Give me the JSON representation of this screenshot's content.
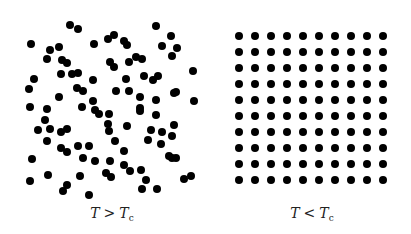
{
  "figure": {
    "dot_color": "#000000",
    "dot_radius": 4,
    "background": "#ffffff"
  },
  "panels": [
    {
      "name": "disordered",
      "caption": {
        "var": "T",
        "op": ">",
        "var2": "T",
        "sub": "c"
      },
      "caption_pos": {
        "x": 112,
        "y": 205
      },
      "dots": [
        [
          70,
          25
        ],
        [
          78,
          29
        ],
        [
          156,
          26
        ],
        [
          31,
          44
        ],
        [
          50,
          50
        ],
        [
          59,
          47
        ],
        [
          94,
          44
        ],
        [
          108,
          39
        ],
        [
          114,
          35
        ],
        [
          124,
          41
        ],
        [
          127,
          45
        ],
        [
          171,
          36
        ],
        [
          162,
          46
        ],
        [
          177,
          48
        ],
        [
          47,
          59
        ],
        [
          62,
          60
        ],
        [
          67,
          63
        ],
        [
          110,
          62
        ],
        [
          114,
          67
        ],
        [
          129,
          62
        ],
        [
          136,
          57
        ],
        [
          142,
          59
        ],
        [
          172,
          56
        ],
        [
          193,
          71
        ],
        [
          34,
          79
        ],
        [
          61,
          74
        ],
        [
          72,
          74
        ],
        [
          78,
          73
        ],
        [
          93,
          80
        ],
        [
          126,
          79
        ],
        [
          144,
          76
        ],
        [
          153,
          80
        ],
        [
          158,
          76
        ],
        [
          29,
          89
        ],
        [
          77,
          88
        ],
        [
          83,
          91
        ],
        [
          116,
          91
        ],
        [
          129,
          91
        ],
        [
          174,
          93
        ],
        [
          176,
          92
        ],
        [
          59,
          97
        ],
        [
          93,
          101
        ],
        [
          140,
          97
        ],
        [
          156,
          100
        ],
        [
          194,
          101
        ],
        [
          30,
          107
        ],
        [
          47,
          109
        ],
        [
          82,
          107
        ],
        [
          95,
          110
        ],
        [
          99,
          114
        ],
        [
          109,
          114
        ],
        [
          140,
          108
        ],
        [
          140,
          111
        ],
        [
          156,
          115
        ],
        [
          45,
          120
        ],
        [
          38,
          130
        ],
        [
          50,
          129
        ],
        [
          61,
          132
        ],
        [
          67,
          129
        ],
        [
          47,
          141
        ],
        [
          108,
          124
        ],
        [
          109,
          131
        ],
        [
          127,
          126
        ],
        [
          115,
          141
        ],
        [
          151,
          130
        ],
        [
          162,
          132
        ],
        [
          174,
          125
        ],
        [
          172,
          136
        ],
        [
          148,
          140
        ],
        [
          161,
          144
        ],
        [
          61,
          148
        ],
        [
          67,
          152
        ],
        [
          78,
          146
        ],
        [
          89,
          146
        ],
        [
          83,
          158
        ],
        [
          95,
          161
        ],
        [
          110,
          161
        ],
        [
          124,
          151
        ],
        [
          124,
          165
        ],
        [
          130,
          171
        ],
        [
          141,
          170
        ],
        [
          146,
          180
        ],
        [
          169,
          156
        ],
        [
          172,
          158
        ],
        [
          176,
          158
        ],
        [
          32,
          159
        ],
        [
          48,
          175
        ],
        [
          80,
          176
        ],
        [
          106,
          173
        ],
        [
          111,
          177
        ],
        [
          30,
          181
        ],
        [
          67,
          185
        ],
        [
          63,
          191
        ],
        [
          89,
          195
        ],
        [
          142,
          189
        ],
        [
          157,
          189
        ],
        [
          184,
          179
        ],
        [
          191,
          176
        ]
      ]
    },
    {
      "name": "ordered-lattice",
      "caption": {
        "var": "T",
        "op": "<",
        "var2": "T",
        "sub": "c"
      },
      "caption_pos": {
        "x": 312,
        "y": 205
      },
      "grid": {
        "cols": 10,
        "rows": 10,
        "x0": 239,
        "y0": 36,
        "dx": 16,
        "dy": 16
      }
    }
  ]
}
